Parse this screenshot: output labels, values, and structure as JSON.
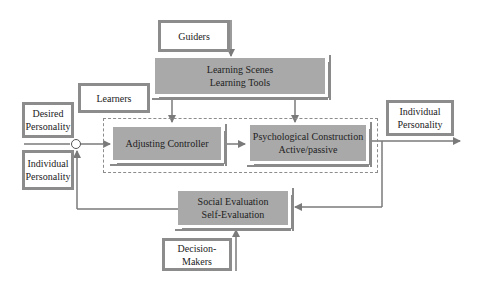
{
  "diagram": {
    "nodes": {
      "guiders": {
        "label": "Guiders"
      },
      "learning_scenes": {
        "line1": "Learning Scenes",
        "line2": "Learning Tools"
      },
      "learners": {
        "label": "Learners"
      },
      "desired_personality": {
        "line1": "Desired",
        "line2": "Personality"
      },
      "individual_personality_in": {
        "line1": "Individual",
        "line2": "Personality"
      },
      "adjusting_controller": {
        "label": "Adjusting Controller"
      },
      "psychological_construction": {
        "line1": "Psychological Construction",
        "line2": "Active/passive"
      },
      "individual_personality_out": {
        "line1": "Individual",
        "line2": "Personality"
      },
      "social_evaluation": {
        "line1": "Social Evaluation",
        "line2": "Self-Evaluation"
      },
      "decision_makers": {
        "line1": "Decision-",
        "line2": "Makers"
      }
    },
    "colors": {
      "box_fill": "#a9a9a9",
      "box_border": "#8c8c8c",
      "line": "#7a7a7a"
    }
  }
}
